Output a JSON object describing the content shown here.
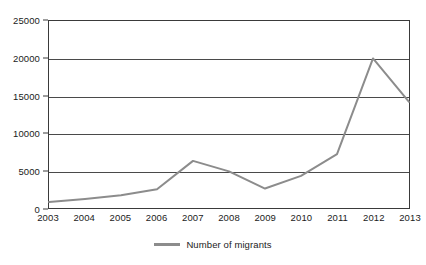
{
  "chart_data": {
    "type": "line",
    "title": "",
    "subtitle": "",
    "xlabel": "",
    "ylabel": "",
    "categories": [
      "2003",
      "2004",
      "2005",
      "2006",
      "2007",
      "2008",
      "2009",
      "2010",
      "2011",
      "2012",
      "2013"
    ],
    "series": [
      {
        "name": "Number of migrants",
        "color": "#8c8c8c",
        "values": [
          800,
          1200,
          1700,
          2500,
          6300,
          4900,
          2600,
          4300,
          7200,
          20000,
          14200
        ]
      }
    ],
    "ylim": [
      0,
      25000
    ],
    "yticks": [
      0,
      5000,
      10000,
      15000,
      20000,
      25000
    ],
    "ytick_labels": [
      "0",
      "5000",
      "10000",
      "15000",
      "20000",
      "25000"
    ],
    "grid": true,
    "grid_axis": "y",
    "legend": {
      "position": "bottom",
      "entries": [
        {
          "label": "Number of migrants",
          "color": "#8c8c8c",
          "marker": "line"
        }
      ]
    },
    "annotations": [],
    "colors": {
      "line": "#8c8c8c",
      "grid": "#4a4a4a",
      "axis": "#3a3a3a",
      "text": "#1b1b1b",
      "background": "#ffffff"
    }
  }
}
